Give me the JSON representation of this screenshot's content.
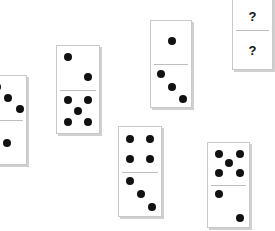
{
  "puzzle": {
    "dominoes": [
      {
        "id": "A",
        "top": 3,
        "bottom": 1,
        "partial": true
      },
      {
        "id": "B",
        "top": 2,
        "bottom": 5
      },
      {
        "id": "C",
        "top": 1,
        "bottom": 3
      },
      {
        "id": "D",
        "top": "?",
        "bottom": "?"
      },
      {
        "id": "E",
        "top": 4,
        "bottom": 3
      },
      {
        "id": "F",
        "top": 5,
        "bottom": 2
      }
    ]
  },
  "colors": {
    "pip": "#111111",
    "tile": "#ffffff",
    "border": "#c8c8c8"
  }
}
